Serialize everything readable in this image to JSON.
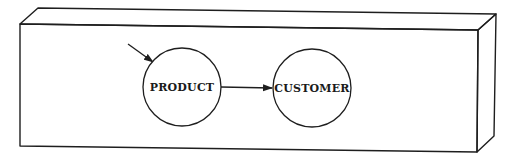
{
  "diagram": {
    "type": "flow-in-3d-box",
    "container": {
      "shape": "rectangular-prism",
      "front_face": [
        [
          20,
          24
        ],
        [
          478,
          30
        ],
        [
          477,
          152
        ],
        [
          20,
          146
        ]
      ],
      "back_top": [
        [
          38,
          8
        ],
        [
          496,
          14
        ]
      ],
      "back_right_bottom": [
        494,
        136
      ]
    },
    "nodes": [
      {
        "id": "product",
        "label": "PRODUCT",
        "cx": 182,
        "cy": 87,
        "r": 39
      },
      {
        "id": "customer",
        "label": "CUSTOMER",
        "cx": 312,
        "cy": 88,
        "r": 39
      }
    ],
    "edges": [
      {
        "from": "external",
        "to": "product",
        "x1": 128,
        "y1": 44,
        "x2": 153,
        "y2": 62
      },
      {
        "from": "product",
        "to": "customer",
        "x1": 221,
        "y1": 87,
        "x2": 272,
        "y2": 88
      }
    ],
    "colors": {
      "stroke": "#1e1e1e",
      "background": "#ffffff"
    }
  }
}
